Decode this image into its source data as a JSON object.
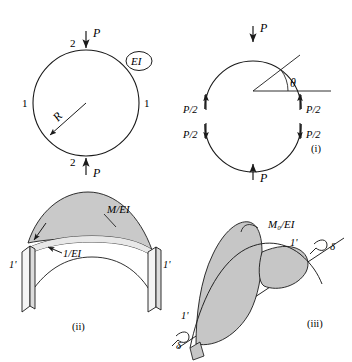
{
  "figure": {
    "panels": [
      {
        "id": "panel-ring",
        "caption": "",
        "labels": {
          "load_top": "P",
          "load_bottom": "P",
          "node_top": "2",
          "node_bottom": "2",
          "node_left": "1",
          "node_right": "1",
          "radius": "R",
          "stiffness": "EI"
        }
      },
      {
        "id": "panel-i",
        "caption": "(i)",
        "labels": {
          "load_top": "P",
          "load_bottom": "P",
          "angle": "θ",
          "shear_left_up": "P/2",
          "shear_left_down": "P/2",
          "shear_right_up": "P/2",
          "shear_right_down": "P/2"
        }
      },
      {
        "id": "panel-ii",
        "caption": "(ii)",
        "labels": {
          "moment_diagram": "M/EI",
          "unit_diagram": "1/EI",
          "end_left": "1'",
          "end_right": "1'"
        }
      },
      {
        "id": "panel-iii",
        "caption": "(iii)",
        "labels": {
          "moment_diagram": "M₀/EI",
          "end_left": "1'",
          "end_right": "1'",
          "deflection_left": "δ",
          "deflection_right": "δ"
        }
      }
    ],
    "colors": {
      "stroke": "#1a1a1a",
      "fill_shaded": "#c8c8c8",
      "fill_shaded_light": "#d8d8d8",
      "background": "#ffffff",
      "block_face": "#f2f2f2"
    }
  }
}
